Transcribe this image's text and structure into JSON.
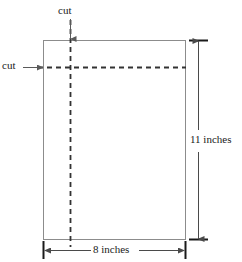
{
  "figure": {
    "background_color": "#ffffff",
    "stroke_color": "#808080",
    "dash_color": "#404040",
    "text_color": "#1a1a1a"
  },
  "labels": {
    "cut_top": "cut",
    "cut_left": "cut",
    "height": "11 inches",
    "width": "8 inches"
  },
  "shape": {
    "name": "sheet-of-paper",
    "kind": "rectangle",
    "x": 43,
    "y": 40,
    "width": 143,
    "height": 200
  },
  "cut_lines": [
    {
      "name": "vertical-cut-line",
      "orientation": "vertical",
      "x": 70,
      "y1": 20,
      "y2": 247,
      "style": "dashed"
    },
    {
      "name": "horizontal-cut-line",
      "orientation": "horizontal",
      "y": 67,
      "x1": 38,
      "x2": 186,
      "style": "dashed"
    }
  ],
  "dimensions": [
    {
      "name": "height-dimension",
      "label": "11 inches",
      "value": 11,
      "unit": "inches",
      "orientation": "vertical",
      "x": 198,
      "y1": 40,
      "y2": 240
    },
    {
      "name": "width-dimension",
      "label": "8 inches",
      "value": 8,
      "unit": "inches",
      "orientation": "horizontal",
      "y": 250,
      "x1": 43,
      "x2": 186
    }
  ],
  "annotations": [
    {
      "name": "cut-top-arrow",
      "label": "cut",
      "from": {
        "x": 70,
        "y": 20
      },
      "to": {
        "x": 70,
        "y": 40
      },
      "direction": "down"
    },
    {
      "name": "cut-left-arrow",
      "label": "cut",
      "from": {
        "x": 24,
        "y": 67
      },
      "to": {
        "x": 44,
        "y": 67
      },
      "direction": "right"
    }
  ]
}
